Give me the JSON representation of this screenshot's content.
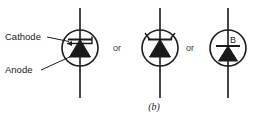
{
  "figure": {
    "caption": "(b)",
    "background_color": "#ffffff",
    "stroke_color": "#1a1a1a",
    "label_color": "#1a1a1a",
    "or_color": "#3a3a3a"
  },
  "labels": {
    "cathode": "Cathode",
    "anode": "Anode",
    "or_first": "or",
    "or_second": "or",
    "gate_b": "B"
  },
  "symbols": [
    {
      "name": "thyristor-hook-gate",
      "circle": {
        "cx": 80,
        "cy": 48,
        "r": 18
      },
      "lead_top_y": 8,
      "lead_bottom_y": 98,
      "gate_style": "hook-right-up"
    },
    {
      "name": "thyristor-v-gate",
      "circle": {
        "cx": 160,
        "cy": 48,
        "r": 18
      },
      "lead_top_y": 8,
      "lead_bottom_y": 98,
      "gate_style": "v-open-up"
    },
    {
      "name": "thyristor-base-b",
      "circle": {
        "cx": 228,
        "cy": 48,
        "r": 18
      },
      "lead_top_y": 8,
      "lead_bottom_y": 98,
      "gate_style": "labelled-b"
    }
  ]
}
